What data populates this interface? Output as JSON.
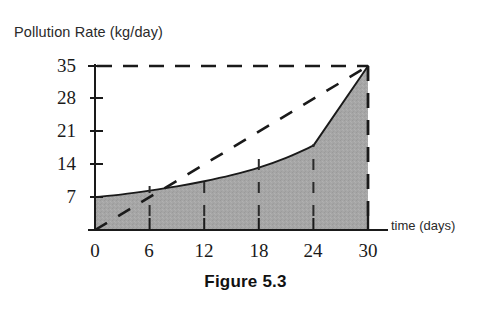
{
  "figure": {
    "caption": "Figure 5.3",
    "y_axis_title": "Pollution Rate (kg/day)",
    "x_axis_title": "time (days)"
  },
  "axes": {
    "x_ticks": [
      "0",
      "6",
      "12",
      "18",
      "24",
      "30"
    ],
    "y_ticks": [
      "35",
      "28",
      "21",
      "14",
      "7"
    ],
    "origin_label": "0"
  },
  "colors": {
    "fill": "#a6a6a6",
    "curve": "#1a1a1a",
    "dashed": "#1a1a1a",
    "axis": "#1a1a1a",
    "background": "#ffffff"
  },
  "chart_data": {
    "type": "area",
    "title": "",
    "xlabel": "time (days)",
    "ylabel": "Pollution Rate (kg/day)",
    "xlim": [
      0,
      30
    ],
    "ylim": [
      0,
      35
    ],
    "xticks": [
      0,
      6,
      12,
      18,
      24,
      30
    ],
    "yticks": [
      7,
      14,
      21,
      28,
      35
    ],
    "grid": false,
    "legend": null,
    "series": [
      {
        "name": "Pollution rate curve",
        "style": "solid-filled-area",
        "fill": "#a6a6a6",
        "x": [
          0,
          3,
          6,
          9,
          12,
          15,
          18,
          21,
          24,
          27,
          30
        ],
        "values": [
          7.0,
          7.6,
          8.4,
          9.3,
          10.4,
          11.7,
          13.3,
          15.4,
          18.0,
          26.5,
          35.0
        ]
      },
      {
        "name": "Average rate (chord from origin)",
        "style": "dashed-line",
        "x": [
          0,
          30
        ],
        "values": [
          0,
          35
        ]
      },
      {
        "name": "Maximum rate level",
        "style": "dashed-horizontal",
        "x": [
          0,
          30
        ],
        "values": [
          35,
          35
        ]
      },
      {
        "name": "Right boundary",
        "style": "dashed-vertical",
        "x": [
          30,
          30
        ],
        "values": [
          0,
          35
        ]
      }
    ]
  }
}
